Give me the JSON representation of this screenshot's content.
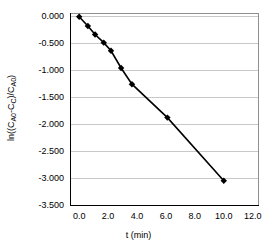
{
  "chart_data": {
    "type": "scatter",
    "title": "",
    "xlabel": "t (min)",
    "ylabel_parts": {
      "prefix": "ln((C",
      "sub1": "A0",
      "mid1": "-C",
      "sub2": "C",
      "mid2": ")/C",
      "sub3": "A0",
      "suffix": ")"
    },
    "ylabel": "ln((CA0-CC)/CA0)",
    "xlim": [
      -0.6,
      12.4
    ],
    "ylim": [
      -3.5,
      0.07
    ],
    "xticks": [
      "0.0",
      "2.0",
      "4.0",
      "6.0",
      "8.0",
      "10.0",
      "12.0"
    ],
    "xtick_values": [
      0,
      2,
      4,
      6,
      8,
      10,
      12
    ],
    "yticks": [
      "0.000",
      "-0.500",
      "-1.000",
      "-1.500",
      "-2.000",
      "-2.500",
      "-3.000",
      "-3.500"
    ],
    "ytick_values": [
      0,
      -0.5,
      -1,
      -1.5,
      -2,
      -2.5,
      -3,
      -3.5
    ],
    "grid": "horizontal",
    "legend": "none",
    "series": [
      {
        "name": "ln((CA0-CC)/CA0) vs t",
        "marker": "filled-diamond",
        "marker_color": "#000000",
        "line_color": "#000000",
        "x": [
          0.0,
          0.6,
          1.1,
          1.7,
          2.2,
          2.9,
          3.65,
          6.1,
          10.0
        ],
        "y": [
          0.0,
          -0.17,
          -0.33,
          -0.48,
          -0.63,
          -0.95,
          -1.25,
          -1.87,
          -3.04
        ]
      }
    ]
  },
  "style": {
    "background": "#ffffff",
    "grid_color": "#c8c8c8",
    "frame_color": "#909090",
    "axis_color": "#000000",
    "text_color": "#000000"
  }
}
